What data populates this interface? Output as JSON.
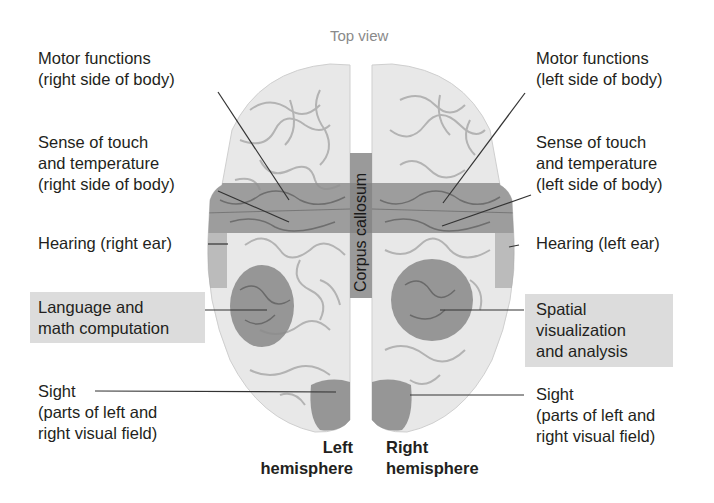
{
  "title": "Top view",
  "corpus_callosum_label": "Corpus callosum",
  "colors": {
    "brain_fill": "#e6e6e6",
    "brain_outline": "#c8c8c8",
    "sulci": "#a9a9a9",
    "band": "#8c8c8c",
    "region": "#8a8a8a",
    "corpus_callosum": "#9a9a9a",
    "label_highlight": "#dcdcdc",
    "leader_line": "#333333",
    "caption": "#8a8a8a"
  },
  "left_labels": {
    "motor": [
      "Motor functions",
      "(right side of body)"
    ],
    "touch": [
      "Sense of touch",
      "and temperature",
      "(right side of body)"
    ],
    "hearing": [
      "Hearing (right ear)"
    ],
    "language": [
      "Language and",
      "math computation"
    ],
    "sight": [
      "Sight",
      "(parts of left and",
      "right visual field)"
    ]
  },
  "right_labels": {
    "motor": [
      "Motor functions",
      "(left side of body)"
    ],
    "touch": [
      "Sense of touch",
      "and temperature",
      "(left side of body)"
    ],
    "hearing": [
      "Hearing (left ear)"
    ],
    "spatial": [
      "Spatial",
      "visualization",
      "and analysis"
    ],
    "sight": [
      "Sight",
      "(parts of left and",
      "right visual field)"
    ]
  },
  "hemispheres": {
    "left": [
      "Left",
      "hemisphere"
    ],
    "right": [
      "Right",
      "hemisphere"
    ]
  }
}
